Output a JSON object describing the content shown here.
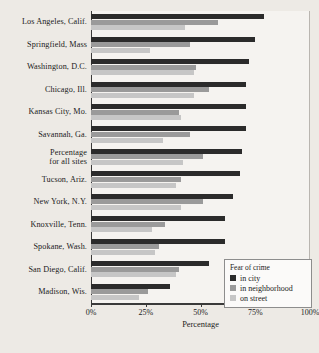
{
  "chart_data": {
    "type": "bar",
    "orientation": "horizontal",
    "title": "",
    "xlabel": "Percentage",
    "ylabel": "",
    "xlim": [
      0,
      100
    ],
    "xticks": [
      "0%",
      "25%",
      "50%",
      "75%",
      "100%"
    ],
    "xtick_values": [
      0,
      25,
      50,
      75,
      100
    ],
    "grid": false,
    "legend_title": "Fear of crime",
    "legend_position": "bottom-right",
    "categories": [
      "Los Angeles, Calif.",
      "Springfield, Mass",
      "Washington, D.C.",
      "Chicago, Ill.",
      "Kansas City, Mo.",
      "Savannah, Ga.",
      "Percentage\nfor all sites",
      "Tucson, Ariz.",
      "New York, N.Y.",
      "Knoxville, Tenn.",
      "Spokane, Wash.",
      "San Diego, Calif.",
      "Madison, Wis."
    ],
    "series": [
      {
        "name": "in city",
        "color": "#2b2b2b",
        "values": [
          79,
          75,
          72,
          71,
          71,
          71,
          69,
          68,
          65,
          61,
          61,
          54,
          36
        ]
      },
      {
        "name": "in neighborhood",
        "color": "#9a9a9a",
        "values": [
          58,
          45,
          48,
          54,
          40,
          45,
          51,
          41,
          51,
          34,
          31,
          40,
          26
        ]
      },
      {
        "name": "on street",
        "color": "#c6c6c6",
        "values": [
          43,
          27,
          47,
          47,
          41,
          33,
          42,
          39,
          41,
          28,
          29,
          39,
          22
        ]
      }
    ]
  }
}
